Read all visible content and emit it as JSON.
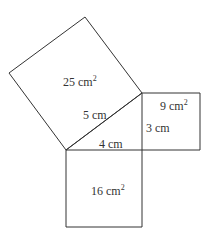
{
  "diagram": {
    "type": "pythagorean-theorem-squares",
    "stroke_color": "#333333",
    "background": "#ffffff",
    "triangle": {
      "hypotenuse": "5 cm",
      "horizontal_leg": "4 cm",
      "vertical_leg": "3 cm"
    },
    "squares": {
      "large": {
        "area": "25 cm",
        "unit_sup": "2"
      },
      "small": {
        "area": "9 cm",
        "unit_sup": "2"
      },
      "medium": {
        "area": "16 cm",
        "unit_sup": "2"
      }
    }
  }
}
